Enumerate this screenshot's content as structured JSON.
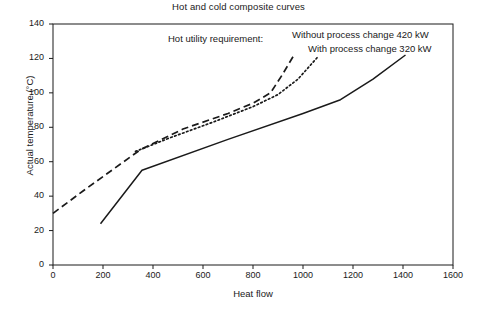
{
  "chart_data": {
    "type": "line",
    "title": "Hot and cold composite curves",
    "xlabel": "Heat flow",
    "ylabel": "Actual temperature (°C)",
    "xlim": [
      0,
      1600
    ],
    "ylim": [
      0,
      140
    ],
    "xticks": [
      0,
      200,
      400,
      600,
      800,
      1000,
      1200,
      1400,
      1600
    ],
    "yticks": [
      0,
      20,
      40,
      60,
      80,
      100,
      120,
      140
    ],
    "grid": false,
    "legend_position": "none",
    "annotations": {
      "prefix": "Hot utility requirement:",
      "line1": "Without process change 420 kW",
      "line2": "With process change 320 kW"
    },
    "series": [
      {
        "name": "Hot composite curve (without process change)",
        "style": "dashed",
        "color": "#1a1a1a",
        "points": [
          [
            0,
            30
          ],
          [
            120,
            43
          ],
          [
            350,
            67
          ],
          [
            520,
            79
          ],
          [
            700,
            88
          ],
          [
            800,
            94
          ],
          [
            870,
            100
          ],
          [
            915,
            110
          ],
          [
            960,
            121
          ]
        ]
      },
      {
        "name": "Hot composite curve (with process change)",
        "style": "dotted",
        "color": "#1a1a1a",
        "points": [
          [
            330,
            66
          ],
          [
            470,
            74
          ],
          [
            640,
            83
          ],
          [
            800,
            92
          ],
          [
            900,
            99
          ],
          [
            980,
            108
          ],
          [
            1060,
            121
          ]
        ]
      },
      {
        "name": "Cold composite curve",
        "style": "solid",
        "color": "#1a1a1a",
        "points": [
          [
            190,
            24
          ],
          [
            356,
            55
          ],
          [
            700,
            73
          ],
          [
            1000,
            88
          ],
          [
            1150,
            96
          ],
          [
            1280,
            108
          ],
          [
            1410,
            122
          ]
        ]
      }
    ]
  },
  "axes": {
    "x_tick_labels": [
      "0",
      "200",
      "400",
      "600",
      "800",
      "1000",
      "1200",
      "1400",
      "1600"
    ],
    "y_tick_labels": [
      "0",
      "20",
      "40",
      "60",
      "80",
      "100",
      "120",
      "140"
    ]
  }
}
